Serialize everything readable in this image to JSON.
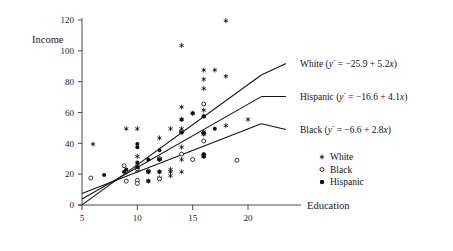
{
  "chart_data": {
    "type": "scatter",
    "title": "",
    "xlabel": "Education",
    "ylabel": "Income",
    "xlim": [
      4.2,
      22.0
    ],
    "ylim": [
      0,
      126
    ],
    "xticks": [
      5,
      10,
      15,
      20
    ],
    "yticks": [
      0,
      20,
      40,
      60,
      80,
      100,
      120
    ],
    "grid": false,
    "legend_position": "right-lower",
    "legend": [
      {
        "label": "White",
        "marker": "asterisk"
      },
      {
        "label": "Black",
        "marker": "open-circle"
      },
      {
        "label": "Hispanic",
        "marker": "filled-dot"
      }
    ],
    "series": [
      {
        "name": "White",
        "marker": "asterisk",
        "points": [
          [
            9,
            49.5
          ],
          [
            10,
            49.5
          ],
          [
            10,
            31.5
          ],
          [
            10,
            25.5
          ],
          [
            10,
            22.5
          ],
          [
            11,
            21.5
          ],
          [
            11,
            15.5
          ],
          [
            12,
            43.5
          ],
          [
            12,
            30.0
          ],
          [
            12,
            29.5
          ],
          [
            12,
            21.5
          ],
          [
            12,
            17.5
          ],
          [
            13,
            49.5
          ],
          [
            13,
            23.0
          ],
          [
            13,
            21.5
          ],
          [
            13,
            19.0
          ],
          [
            14,
            103.5
          ],
          [
            14,
            63.5
          ],
          [
            14,
            55.5
          ],
          [
            14,
            49.5
          ],
          [
            14,
            47.5
          ],
          [
            14,
            37.5
          ],
          [
            14,
            29.5
          ],
          [
            14,
            21.5
          ],
          [
            15,
            59.5
          ],
          [
            16,
            87.5
          ],
          [
            16,
            81.5
          ],
          [
            16,
            75.5
          ],
          [
            16,
            61.5
          ],
          [
            16,
            57.5
          ],
          [
            16,
            47.5
          ],
          [
            16,
            46.0
          ],
          [
            16,
            32.0
          ],
          [
            16,
            31.5
          ],
          [
            17,
            87.5
          ],
          [
            18,
            119.5
          ],
          [
            18,
            83.5
          ],
          [
            18,
            51.5
          ],
          [
            20,
            55.5
          ],
          [
            6,
            39.5
          ]
        ]
      },
      {
        "name": "Black",
        "marker": "open-circle",
        "points": [
          [
            5.8,
            17.5
          ],
          [
            8.8,
            25.5
          ],
          [
            9,
            15.5
          ],
          [
            10,
            23.5
          ],
          [
            10,
            16.0
          ],
          [
            10,
            14.0
          ],
          [
            12,
            30.0
          ],
          [
            12,
            17.0
          ],
          [
            14,
            47.5
          ],
          [
            14,
            33.0
          ],
          [
            15,
            29.5
          ],
          [
            16,
            65.5
          ],
          [
            16,
            41.5
          ],
          [
            16,
            46.5
          ],
          [
            16,
            32.5
          ],
          [
            19,
            29.0
          ],
          [
            11,
            22.0
          ]
        ]
      },
      {
        "name": "Hispanic",
        "marker": "filled-dot",
        "points": [
          [
            7,
            19.5
          ],
          [
            8.8,
            21.5
          ],
          [
            9,
            23.0
          ],
          [
            10,
            39.5
          ],
          [
            10,
            37.5
          ],
          [
            10,
            27.5
          ],
          [
            10,
            24.5
          ],
          [
            11,
            29.5
          ],
          [
            11,
            21.5
          ],
          [
            11,
            15.5
          ],
          [
            12,
            35.5
          ],
          [
            12,
            29.5
          ],
          [
            12,
            21.5
          ],
          [
            14,
            55.5
          ],
          [
            14,
            47.0
          ],
          [
            15,
            59.5
          ],
          [
            16,
            57.5
          ],
          [
            16,
            46.5
          ],
          [
            16,
            33.0
          ],
          [
            16,
            31.5
          ],
          [
            17,
            49.5
          ]
        ]
      }
    ],
    "fit_lines": [
      {
        "name": "White",
        "intercept": -25.9,
        "slope": 5.2,
        "x_start": 5.0,
        "x_end": 21.2,
        "label": "White (",
        "label_eq_hat": "y",
        "label_eq_rest": " = −25.9 + 5.2",
        "label_eq_x": "x",
        "label_close": ")"
      },
      {
        "name": "Hispanic",
        "intercept": -16.6,
        "slope": 4.1,
        "x_start": 5.0,
        "x_end": 21.2,
        "label": "Hispanic (",
        "label_eq_hat": "y",
        "label_eq_rest": " = −16.6 + 4.1",
        "label_eq_x": "x",
        "label_close": ")"
      },
      {
        "name": "Black",
        "intercept": -6.6,
        "slope": 2.8,
        "x_start": 5.0,
        "x_end": 21.2,
        "label": "Black (",
        "label_eq_hat": "y",
        "label_eq_rest": " = −6.6 + 2.8",
        "label_eq_x": "x",
        "label_close": ")"
      }
    ]
  },
  "axis": {
    "y_title": "Income",
    "x_title": "Education",
    "xtick_labels": [
      "5",
      "10",
      "15",
      "20"
    ],
    "ytick_labels": [
      "0",
      "20",
      "40",
      "60",
      "80",
      "100",
      "120"
    ]
  },
  "colors": {
    "ink": "#111111",
    "axis": "#4a4a4a",
    "background": "#ffffff"
  }
}
